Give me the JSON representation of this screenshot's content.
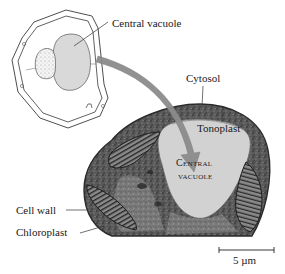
{
  "figure": {
    "type": "plant cell diagram with electron micrograph",
    "colors": {
      "outline": "#3a3a3a",
      "vacuole_fill": "#d9d9d9",
      "arrow": "#8c8c8c",
      "cytosol_dark": "#4a4a4a",
      "vacuole_micrograph": "#cfcfcf",
      "leader_line": "#333333"
    }
  },
  "labels": {
    "central_vacuole_top": "Central vacuole",
    "cytosol": "Cytosol",
    "tonoplast": "Tonoplast",
    "central_vacuole_line1": "Central",
    "central_vacuole_line2": "vacuole",
    "cell_wall": "Cell wall",
    "chloroplast": "Chloroplast"
  },
  "scale_bar": {
    "label": "5 µm"
  }
}
